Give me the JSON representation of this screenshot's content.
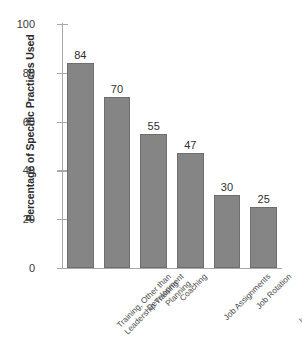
{
  "chart_data": {
    "type": "bar",
    "title": "",
    "xlabel": "",
    "ylabel": "Percentage of Specific Practices Used",
    "ylim": [
      0,
      100
    ],
    "ytick_labels": [
      "0",
      "20",
      "40",
      "60",
      "80",
      "100"
    ],
    "yticks": [
      0,
      20,
      40,
      60,
      80,
      100
    ],
    "grid": false,
    "legend": false,
    "categories": [
      "Training, Other than Leadership Training",
      "Development Planning",
      "Coaching",
      "Job Assignments",
      "Job Rotation",
      "Internal Mentoring Programs"
    ],
    "category_lines": [
      [
        "Training, Other than",
        "Leadership Training"
      ],
      [
        "Development",
        "Planning"
      ],
      [
        "Coaching"
      ],
      [
        "Job Assignments"
      ],
      [
        "Job Rotation"
      ],
      [
        "Internal Mentoring",
        "Programs"
      ]
    ],
    "values": [
      84,
      70,
      55,
      47,
      30,
      25
    ],
    "value_labels": [
      "84",
      "70",
      "55",
      "47",
      "30",
      "25"
    ],
    "colors": {
      "bar_fill": "#858585",
      "bar_stroke": "#6e6e6e",
      "axis": "#a8a8a8",
      "tick_text": "#3a3a3a",
      "value_text": "#2f2f2f",
      "category_text": "#4a4a4a",
      "title_text": "#2b2b2b",
      "background": "#ffffff"
    }
  }
}
